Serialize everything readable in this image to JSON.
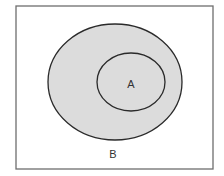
{
  "diagram": {
    "type": "venn-subset",
    "colors": {
      "background": "#ffffff",
      "frame_stroke": "#6e6e6e",
      "set_fill": "#dcdcdc",
      "set_stroke": "#2a2a2a",
      "label_color": "#333333"
    },
    "universe": {
      "x": 16,
      "y": 6,
      "width": 197,
      "height": 163
    },
    "sets": [
      {
        "id": "B",
        "label": "B",
        "cx": 115,
        "cy": 82,
        "rx": 67,
        "ry": 58,
        "label_x": 113,
        "label_y": 158
      },
      {
        "id": "A",
        "label": "A",
        "cx": 131,
        "cy": 82,
        "rx": 34,
        "ry": 29,
        "label_x": 131,
        "label_y": 88
      }
    ]
  }
}
